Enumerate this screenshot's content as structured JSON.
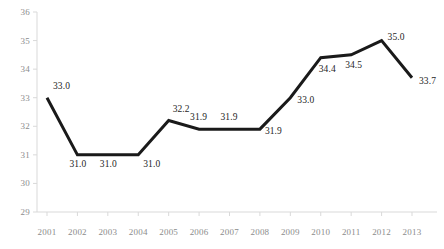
{
  "chart_data": {
    "type": "line",
    "title": "",
    "subtitle": "",
    "xlabel": "",
    "ylabel": "",
    "categories": [
      "2001",
      "2002",
      "2003",
      "2004",
      "2005",
      "2006",
      "2007",
      "2008",
      "2009",
      "2010",
      "2011",
      "2012",
      "2013"
    ],
    "values": [
      33.0,
      31.0,
      31.0,
      31.0,
      32.2,
      31.9,
      31.9,
      31.9,
      33.0,
      34.4,
      34.5,
      35.0,
      33.7
    ],
    "data_labels": [
      "33.0",
      "31.0",
      "31.0",
      "31.0",
      "32.2",
      "31.9",
      "31.9",
      "31.9",
      "33.0",
      "34.4",
      "34.5",
      "35.0",
      "33.7"
    ],
    "ylim": [
      29,
      36
    ],
    "yticks": [
      29,
      30,
      31,
      32,
      33,
      34,
      35,
      36
    ],
    "ytick_labels": [
      "29",
      "30",
      "31",
      "32",
      "33",
      "34",
      "35",
      "36"
    ],
    "grid": false,
    "legend": false,
    "legend_position": "none",
    "series": [
      {
        "name": "",
        "values": [
          33.0,
          31.0,
          31.0,
          31.0,
          32.2,
          31.9,
          31.9,
          31.9,
          33.0,
          34.4,
          34.5,
          35.0,
          33.7
        ],
        "color": "#1a1a1a"
      }
    ],
    "colors": {
      "line": "#1a1a1a",
      "axis": "#d9d9d9",
      "tick_text": "#8c8c8c",
      "data_label_text": "#262626",
      "background": "#ffffff"
    }
  }
}
